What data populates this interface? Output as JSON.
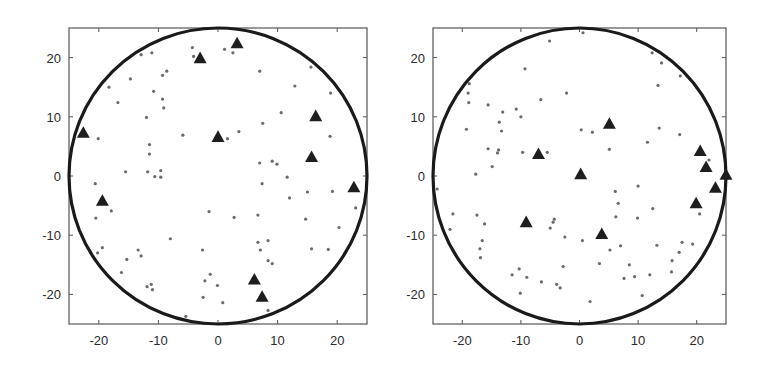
{
  "figure": {
    "panel_count": 2,
    "colors": {
      "circle": "#1a1a1a",
      "axes": "#555555",
      "dot": "#6a6a6a",
      "triangle": "#1e1e1e",
      "text": "#2a2a2a"
    }
  },
  "chart_data": [
    {
      "type": "scatter",
      "title": "",
      "xlabel": "",
      "ylabel": "",
      "xlim": [
        -25,
        25
      ],
      "ylim": [
        -25,
        25
      ],
      "xticks": [
        -20,
        -10,
        0,
        10,
        20
      ],
      "yticks": [
        -20,
        -10,
        0,
        10,
        20
      ],
      "xtick_labels": [
        "-20",
        "-10",
        "0",
        "10",
        "20"
      ],
      "ytick_labels": [
        "-20",
        "-10",
        "0",
        "10",
        "20"
      ],
      "grid": false,
      "legend": null,
      "boundary_circle": {
        "cx": 0,
        "cy": 0,
        "r": 25
      },
      "series": [
        {
          "name": "triangles",
          "marker": "triangle",
          "points": [
            [
              -22.6,
              7.3
            ],
            [
              -3.0,
              19.9
            ],
            [
              3.2,
              22.4
            ],
            [
              0.0,
              6.6
            ],
            [
              16.4,
              10.1
            ],
            [
              15.7,
              3.2
            ],
            [
              22.8,
              -1.9
            ],
            [
              -19.4,
              -4.2
            ],
            [
              6.1,
              -17.5
            ],
            [
              7.4,
              -20.4
            ]
          ]
        },
        {
          "name": "dots",
          "marker": "dot",
          "points": [
            [
              -4.3,
              21.7
            ],
            [
              -4.1,
              20.2
            ],
            [
              1.1,
              21.4
            ],
            [
              2.5,
              20.8
            ],
            [
              -12.9,
              20.5
            ],
            [
              -11.1,
              20.8
            ],
            [
              -9.3,
              17.0
            ],
            [
              -8.6,
              17.7
            ],
            [
              -14.7,
              16.4
            ],
            [
              -18.3,
              15.0
            ],
            [
              -10.8,
              14.3
            ],
            [
              -16.8,
              12.4
            ],
            [
              -9.3,
              13.0
            ],
            [
              -9.1,
              11.5
            ],
            [
              -12.0,
              9.9
            ],
            [
              -5.9,
              6.9
            ],
            [
              1.6,
              6.3
            ],
            [
              3.5,
              7.5
            ],
            [
              7.0,
              17.7
            ],
            [
              12.9,
              15.2
            ],
            [
              15.6,
              18.4
            ],
            [
              18.9,
              14.0
            ],
            [
              10.6,
              10.7
            ],
            [
              7.5,
              8.9
            ],
            [
              18.8,
              6.7
            ],
            [
              -20.1,
              6.3
            ],
            [
              -11.5,
              5.3
            ],
            [
              -11.5,
              3.7
            ],
            [
              -15.5,
              0.7
            ],
            [
              -11.8,
              0.7
            ],
            [
              -9.6,
              0.9
            ],
            [
              -10.6,
              -0.1
            ],
            [
              -9.6,
              -0.2
            ],
            [
              7.0,
              2.2
            ],
            [
              9.1,
              2.5
            ],
            [
              9.9,
              2.0
            ],
            [
              11.6,
              -0.2
            ],
            [
              7.4,
              -1.3
            ],
            [
              12.0,
              -3.7
            ],
            [
              15.0,
              -2.7
            ],
            [
              19.2,
              -2.6
            ],
            [
              -20.6,
              -1.3
            ],
            [
              -17.9,
              -5.9
            ],
            [
              -20.5,
              -7.1
            ],
            [
              -1.5,
              -6.0
            ],
            [
              2.7,
              -7.0
            ],
            [
              6.7,
              -6.6
            ],
            [
              23.1,
              -5.4
            ],
            [
              14.7,
              -7.3
            ],
            [
              20.3,
              -8.7
            ],
            [
              -8.0,
              -10.6
            ],
            [
              -2.6,
              -12.5
            ],
            [
              -13.4,
              -12.5
            ],
            [
              -12.9,
              -13.5
            ],
            [
              -20.2,
              -13.0
            ],
            [
              -19.4,
              -12.1
            ],
            [
              -15.3,
              -14.1
            ],
            [
              -16.2,
              -16.3
            ],
            [
              -11.9,
              -18.7
            ],
            [
              -11.2,
              -18.3
            ],
            [
              -11.0,
              -19.2
            ],
            [
              -1.3,
              -16.6
            ],
            [
              -2.2,
              -17.7
            ],
            [
              -0.1,
              -18.5
            ],
            [
              -2.5,
              -20.5
            ],
            [
              0.8,
              -21.4
            ],
            [
              6.7,
              -11.2
            ],
            [
              7.1,
              -12.5
            ],
            [
              8.4,
              -10.9
            ],
            [
              8.4,
              -14.3
            ],
            [
              9.1,
              -14.8
            ],
            [
              15.7,
              -12.3
            ],
            [
              18.5,
              -12.4
            ],
            [
              8.4,
              -22.7
            ],
            [
              -5.4,
              -23.7
            ]
          ]
        }
      ]
    },
    {
      "type": "scatter",
      "title": "",
      "xlabel": "",
      "ylabel": "",
      "xlim": [
        -25,
        25
      ],
      "ylim": [
        -25,
        25
      ],
      "xticks": [
        -20,
        -10,
        0,
        10,
        20
      ],
      "yticks": [
        -20,
        -10,
        0,
        10,
        20
      ],
      "xtick_labels": [
        "-20",
        "-10",
        "0",
        "10",
        "20"
      ],
      "ytick_labels": [
        "-20",
        "-10",
        "0",
        "10",
        "20"
      ],
      "grid": false,
      "legend": null,
      "boundary_circle": {
        "cx": 0,
        "cy": 0,
        "r": 25
      },
      "series": [
        {
          "name": "triangles",
          "marker": "triangle",
          "points": [
            [
              5.1,
              8.8
            ],
            [
              -7.0,
              3.7
            ],
            [
              0.2,
              0.3
            ],
            [
              -9.1,
              -7.8
            ],
            [
              3.8,
              -9.8
            ],
            [
              20.6,
              4.2
            ],
            [
              21.6,
              1.5
            ],
            [
              25.0,
              0.2
            ],
            [
              23.2,
              -2.0
            ],
            [
              19.9,
              -4.6
            ]
          ]
        },
        {
          "name": "dots",
          "marker": "dot",
          "points": [
            [
              0.6,
              24.2
            ],
            [
              -5.1,
              22.8
            ],
            [
              -9.3,
              18.1
            ],
            [
              -2.2,
              14.0
            ],
            [
              -6.6,
              12.9
            ],
            [
              12.4,
              20.8
            ],
            [
              14.0,
              19.1
            ],
            [
              17.2,
              16.9
            ],
            [
              13.4,
              15.3
            ],
            [
              -18.8,
              15.6
            ],
            [
              -19.0,
              14.0
            ],
            [
              -18.9,
              12.4
            ],
            [
              -15.6,
              12.0
            ],
            [
              -13.1,
              10.8
            ],
            [
              -10.8,
              11.3
            ],
            [
              -10.0,
              10.0
            ],
            [
              -13.7,
              9.1
            ],
            [
              -13.3,
              7.6
            ],
            [
              -19.3,
              7.9
            ],
            [
              0.3,
              7.8
            ],
            [
              2.2,
              7.4
            ],
            [
              13.6,
              8.1
            ],
            [
              17.1,
              7.0
            ],
            [
              11.6,
              5.7
            ],
            [
              5.1,
              4.5
            ],
            [
              -15.6,
              4.6
            ],
            [
              -13.8,
              4.4
            ],
            [
              -14.0,
              3.9
            ],
            [
              -9.7,
              4.0
            ],
            [
              -5.5,
              4.0
            ],
            [
              -14.9,
              1.6
            ],
            [
              -17.7,
              0.3
            ],
            [
              22.1,
              2.7
            ],
            [
              -24.3,
              -2.2
            ],
            [
              6.1,
              -2.6
            ],
            [
              10.0,
              -1.7
            ],
            [
              6.6,
              -4.6
            ],
            [
              12.5,
              -5.5
            ],
            [
              20.5,
              -6.4
            ],
            [
              9.9,
              -7.1
            ],
            [
              6.2,
              -6.9
            ],
            [
              -21.6,
              -6.4
            ],
            [
              -17.5,
              -6.6
            ],
            [
              -16.2,
              -8.1
            ],
            [
              -22.1,
              -9.0
            ],
            [
              -4.3,
              -7.3
            ],
            [
              -4.5,
              -7.8
            ],
            [
              -5.0,
              -8.8
            ],
            [
              -2.5,
              -10.3
            ],
            [
              0.5,
              -10.9
            ],
            [
              5.2,
              -12.5
            ],
            [
              7.0,
              -11.8
            ],
            [
              13.2,
              -11.7
            ],
            [
              -16.6,
              -10.9
            ],
            [
              -17.0,
              -12.3
            ],
            [
              -16.9,
              -13.8
            ],
            [
              17.5,
              -11.2
            ],
            [
              17.0,
              -12.9
            ],
            [
              19.3,
              -11.5
            ],
            [
              15.8,
              -14.3
            ],
            [
              15.7,
              -16.2
            ],
            [
              3.4,
              -14.8
            ],
            [
              8.5,
              -15.0
            ],
            [
              -2.8,
              -15.3
            ],
            [
              -11.5,
              -16.7
            ],
            [
              -9.0,
              -17.1
            ],
            [
              -6.5,
              -17.9
            ],
            [
              -3.9,
              -18.3
            ],
            [
              -3.3,
              -18.9
            ],
            [
              7.6,
              -17.3
            ],
            [
              9.4,
              -17.0
            ],
            [
              12.0,
              -16.7
            ],
            [
              -10.3,
              -15.7
            ],
            [
              -10.1,
              -19.8
            ],
            [
              10.7,
              -20.2
            ],
            [
              1.8,
              -21.2
            ]
          ]
        }
      ]
    }
  ]
}
